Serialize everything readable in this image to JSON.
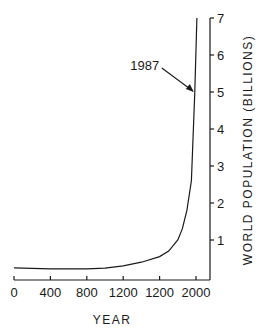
{
  "chart_data": {
    "type": "line",
    "title": "",
    "xlabel": "YEAR",
    "ylabel": "WORLD POPULATION (BILLIONS)",
    "y_axis_position": "right",
    "x_tick_labels": [
      "0",
      "400",
      "800",
      "1200",
      "1200",
      "2000"
    ],
    "x_ticks": [
      0,
      400,
      800,
      1200,
      1600,
      2000
    ],
    "y_ticks": [
      1,
      2,
      3,
      4,
      5,
      6,
      7
    ],
    "y_tick_labels": [
      "1",
      "2",
      "3",
      "4",
      "5",
      "6",
      "7"
    ],
    "xlim": [
      0,
      2100
    ],
    "ylim": [
      0,
      7
    ],
    "grid": false,
    "legend": null,
    "series": [
      {
        "name": "World population",
        "x": [
          0,
          400,
          800,
          1000,
          1200,
          1400,
          1600,
          1700,
          1800,
          1850,
          1900,
          1950,
          1987,
          2010
        ],
        "values": [
          0.25,
          0.22,
          0.22,
          0.24,
          0.3,
          0.4,
          0.55,
          0.7,
          1.0,
          1.3,
          1.8,
          2.6,
          5.0,
          7.0
        ]
      }
    ],
    "annotations": [
      {
        "text": "1987",
        "x": 1987,
        "y": 5.0,
        "arrow": true
      }
    ]
  }
}
